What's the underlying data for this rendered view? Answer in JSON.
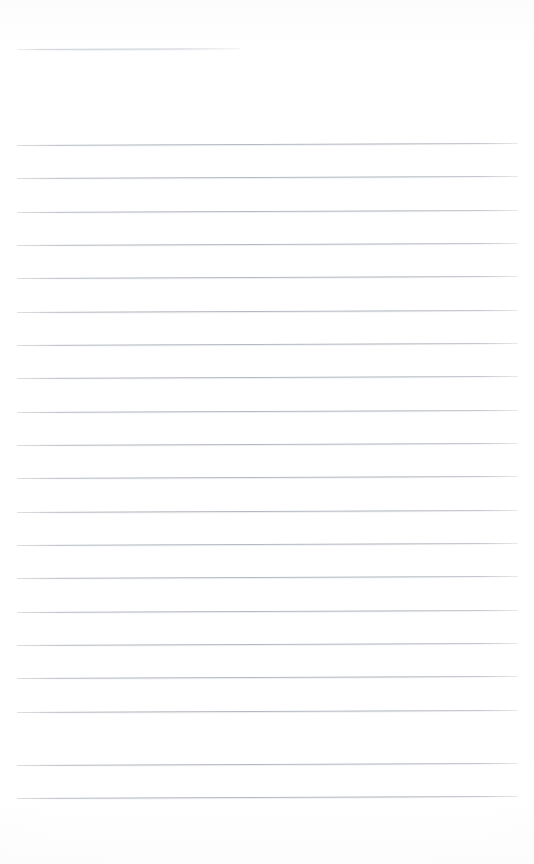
{
  "document": {
    "type": "scanned-ruled-paper",
    "title": "",
    "page_width": 534,
    "page_height": 864,
    "background_color": "#fefefe",
    "rule_color": "#a8adb6",
    "rule_thickness_px": 1,
    "content_text": "",
    "is_blank": true
  },
  "layout": {
    "left_margin_x": 17,
    "right_margin_x": 518,
    "first_rule_y": 145,
    "rule_spacing_px": 33.4,
    "full_rule_count": 20,
    "bottom_blank_margin_y": 805,
    "skew_degrees": -0.22
  },
  "rules": [
    {
      "id": "header-rule",
      "y": 49,
      "x1": 17,
      "x2": 240,
      "variant": "short"
    },
    {
      "id": "rule-01",
      "y": 145,
      "x1": 17,
      "x2": 518,
      "variant": "full"
    },
    {
      "id": "rule-02",
      "y": 178,
      "x1": 17,
      "x2": 518,
      "variant": "full"
    },
    {
      "id": "rule-03",
      "y": 212,
      "x1": 17,
      "x2": 518,
      "variant": "full"
    },
    {
      "id": "rule-04",
      "y": 245,
      "x1": 17,
      "x2": 518,
      "variant": "full"
    },
    {
      "id": "rule-05",
      "y": 278,
      "x1": 17,
      "x2": 518,
      "variant": "full"
    },
    {
      "id": "rule-06",
      "y": 312,
      "x1": 17,
      "x2": 518,
      "variant": "full"
    },
    {
      "id": "rule-07",
      "y": 345,
      "x1": 17,
      "x2": 518,
      "variant": "full"
    },
    {
      "id": "rule-08",
      "y": 378,
      "x1": 17,
      "x2": 518,
      "variant": "full"
    },
    {
      "id": "rule-09",
      "y": 412,
      "x1": 17,
      "x2": 518,
      "variant": "full"
    },
    {
      "id": "rule-10",
      "y": 445,
      "x1": 17,
      "x2": 518,
      "variant": "full"
    },
    {
      "id": "rule-11",
      "y": 478,
      "x1": 17,
      "x2": 518,
      "variant": "full"
    },
    {
      "id": "rule-12",
      "y": 512,
      "x1": 17,
      "x2": 518,
      "variant": "full"
    },
    {
      "id": "rule-13",
      "y": 545,
      "x1": 17,
      "x2": 518,
      "variant": "full"
    },
    {
      "id": "rule-14",
      "y": 578,
      "x1": 17,
      "x2": 518,
      "variant": "full"
    },
    {
      "id": "rule-15",
      "y": 612,
      "x1": 17,
      "x2": 518,
      "variant": "full"
    },
    {
      "id": "rule-16",
      "y": 645,
      "x1": 17,
      "x2": 518,
      "variant": "full"
    },
    {
      "id": "rule-17",
      "y": 678,
      "x1": 17,
      "x2": 518,
      "variant": "full"
    },
    {
      "id": "rule-18",
      "y": 712,
      "x1": 17,
      "x2": 518,
      "variant": "full"
    },
    {
      "id": "rule-19",
      "y": 765,
      "x1": 17,
      "x2": 518,
      "variant": "full"
    },
    {
      "id": "rule-20",
      "y": 798,
      "x1": 17,
      "x2": 518,
      "variant": "full"
    }
  ]
}
